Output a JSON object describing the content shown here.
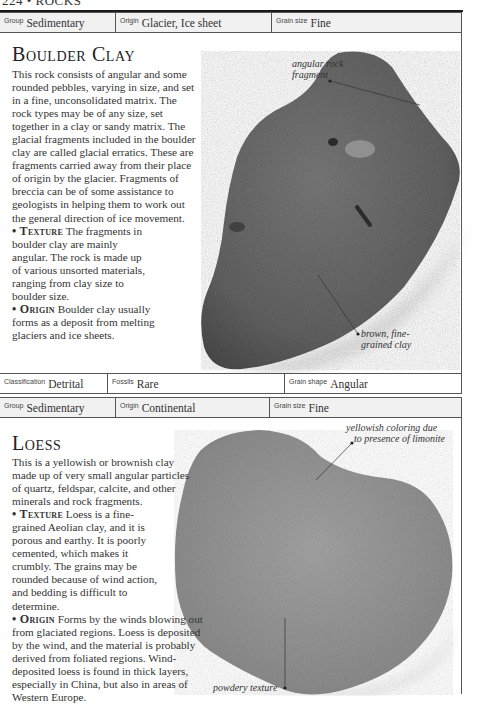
{
  "page": {
    "running_head": "224 • ROCKS"
  },
  "entries": [
    {
      "title": "Boulder Clay",
      "properties_top": [
        {
          "label": "Group",
          "value": "Sedimentary"
        },
        {
          "label": "Origin",
          "value": "Glacier, Ice sheet"
        },
        {
          "label": "Grain size",
          "value": "Fine"
        }
      ],
      "description": "This rock consists of angular and some rounded pebbles, varying in size, and set in a fine, unconsolidated matrix. The rock types may be of any size, set together in a clay or sandy matrix. The glacial fragments included in the boulder clay are called glacial erratics. These are fragments carried away from their place of origin by the glacier. Fragments of breccia can be of some assistance to geologists in helping them to work out the general direction of ice movement.",
      "texture_label": "• Texture",
      "texture": "The fragments in boulder clay are mainly angular. The rock is made up of various unsorted materials, ranging from clay size to boulder size.",
      "origin_label": "• Origin",
      "origin": "Boulder clay usually forms as a deposit from melting glaciers and ice sheets.",
      "annotations": [
        {
          "text_lines": [
            "angular rock",
            "fragment"
          ]
        },
        {
          "text_lines": [
            "brown, fine-",
            "grained clay"
          ]
        }
      ],
      "properties_bottom": [
        {
          "label": "Classification",
          "value": "Detrital"
        },
        {
          "label": "Fossils",
          "value": "Rare"
        },
        {
          "label": "Grain shape",
          "value": "Angular"
        }
      ],
      "rock_color": "#6e6e6e"
    },
    {
      "title": "Loess",
      "properties_top": [
        {
          "label": "Group",
          "value": "Sedimentary"
        },
        {
          "label": "Origin",
          "value": "Continental"
        },
        {
          "label": "Grain size",
          "value": "Fine"
        }
      ],
      "description": "This is a yellowish or brownish clay made up of very small angular particles of quartz, feldspar, calcite, and other minerals and rock fragments.",
      "texture_label": "• Texture",
      "texture": "Loess is a fine-grained Aeolian clay, and it is porous and earthy. It is poorly cemented, which makes it crumbly. The grains may be rounded because of wind action, and bedding is difficult to determine.",
      "origin_label": "• Origin",
      "origin": "Forms by the winds blowing out from glaciated regions. Loess is deposited by the wind, and the material is probably derived from foliated regions. Wind-deposited loess is found in thick layers, especially in China, but also in areas of Western Europe.",
      "annotations": [
        {
          "text_lines": [
            "yellowish coloring due",
            "to presence of limonite"
          ]
        },
        {
          "text_lines": [
            "powdery texture"
          ]
        }
      ],
      "rock_color": "#8f8f8f"
    }
  ]
}
